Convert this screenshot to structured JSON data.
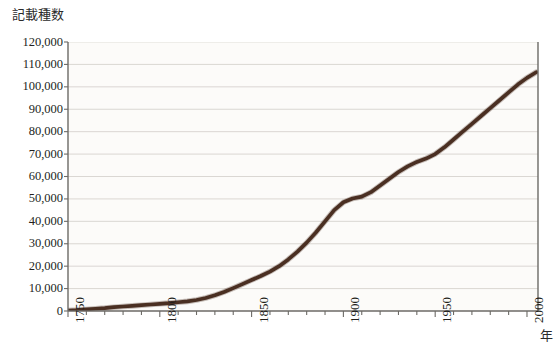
{
  "chart_data": {
    "type": "line",
    "title": "",
    "ylabel": "記載種数",
    "xlabel": "年",
    "xlim": [
      1750,
      2006
    ],
    "ylim": [
      0,
      120000
    ],
    "grid": true,
    "legend": "none",
    "y_ticks": [
      0,
      10000,
      20000,
      30000,
      40000,
      50000,
      60000,
      70000,
      80000,
      90000,
      100000,
      110000,
      120000
    ],
    "y_tick_labels": [
      "0",
      "10,000",
      "20,000",
      "30,000",
      "40,000",
      "50,000",
      "60,000",
      "70,000",
      "80,000",
      "90,000",
      "100,000",
      "110,000",
      "120,000"
    ],
    "x_ticks": [
      1750,
      1800,
      1850,
      1900,
      1950,
      2000
    ],
    "x_tick_labels": [
      "1750",
      "1800",
      "1850",
      "1900",
      "1950",
      "2000"
    ],
    "x_minor_tick_interval": 10,
    "series": [
      {
        "name": "記載種数",
        "color": "#4a2f22",
        "x": [
          1750,
          1755,
          1760,
          1765,
          1770,
          1775,
          1780,
          1785,
          1790,
          1795,
          1800,
          1805,
          1810,
          1815,
          1820,
          1825,
          1830,
          1835,
          1840,
          1845,
          1850,
          1855,
          1860,
          1865,
          1870,
          1875,
          1880,
          1885,
          1890,
          1895,
          1900,
          1905,
          1910,
          1915,
          1920,
          1925,
          1930,
          1935,
          1940,
          1945,
          1950,
          1955,
          1960,
          1965,
          1970,
          1975,
          1980,
          1985,
          1990,
          1995,
          2000,
          2005
        ],
        "values": [
          200,
          400,
          700,
          1000,
          1300,
          1700,
          2000,
          2300,
          2600,
          2900,
          3200,
          3500,
          3900,
          4300,
          4900,
          5800,
          7000,
          8500,
          10200,
          12000,
          13800,
          15600,
          17600,
          20000,
          23000,
          26500,
          30500,
          35000,
          40000,
          45000,
          48500,
          50200,
          51000,
          53000,
          56000,
          59000,
          62000,
          64500,
          66500,
          68000,
          70000,
          73000,
          76500,
          80000,
          83500,
          87000,
          90500,
          94000,
          97500,
          101000,
          104000,
          106500
        ]
      }
    ]
  }
}
